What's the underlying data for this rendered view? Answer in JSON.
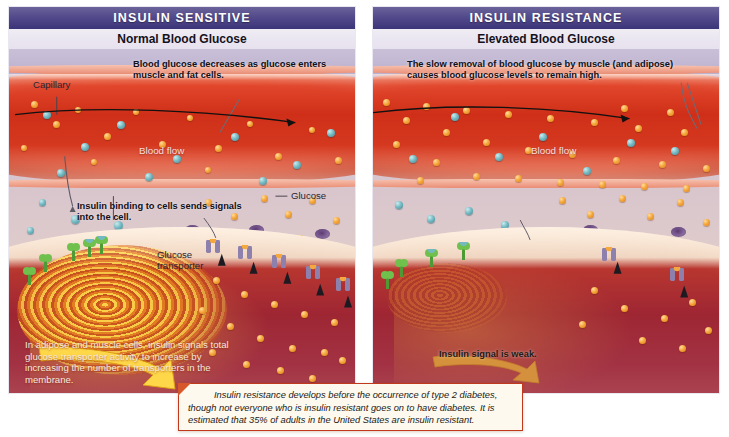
{
  "figure": {
    "colors": {
      "header_bar": "#534a8c",
      "capillary_blood": "#cf2f18",
      "cell_interior": "#9e2633",
      "glucose": "#f5a93c",
      "insulin": "#74b9c2",
      "red_blood_cell": "#7b5b92",
      "receptor_green": "#5fae3f",
      "transporter_purple": "#7c6f9e",
      "signal_yellow": "#ffd84a",
      "caption_border": "#c0391c",
      "caption_fill": "#fdf9ef"
    }
  },
  "panels": [
    {
      "id": "insulin-sensitive",
      "header": "INSULIN SENSITIVE",
      "subtitle": "Normal Blood Glucose",
      "callouts": {
        "top": "Blood glucose decreases as glucose enters muscle and fat cells.",
        "middle": "Insulin binding to cells sends signals into the cell.",
        "bottom": "In adipose and muscle cells, insulin signals total glucose transporter activity to increase by increasing the number of transporters in the membrane."
      },
      "labels": {
        "capillary": "Capillary",
        "blood_flow": "Blood flow",
        "glucose": "Glucose",
        "glucose_transporter": "Glucose transporter"
      }
    },
    {
      "id": "insulin-resistance",
      "header": "INSULIN RESISTANCE",
      "subtitle": "Elevated Blood Glucose",
      "callouts": {
        "top": "The slow removal of blood glucose by muscle (and adipose) causes blood glucose levels to remain high.",
        "bottom": "Insulin signal is weak."
      },
      "labels": {
        "blood_flow": "Blood flow"
      }
    }
  ],
  "caption": {
    "text": "Insulin resistance develops before the occurrence of type 2 diabetes, though not everyone who is insulin resistant goes on to have diabetes. It is estimated that 35% of adults in the United States are insulin resistant."
  }
}
